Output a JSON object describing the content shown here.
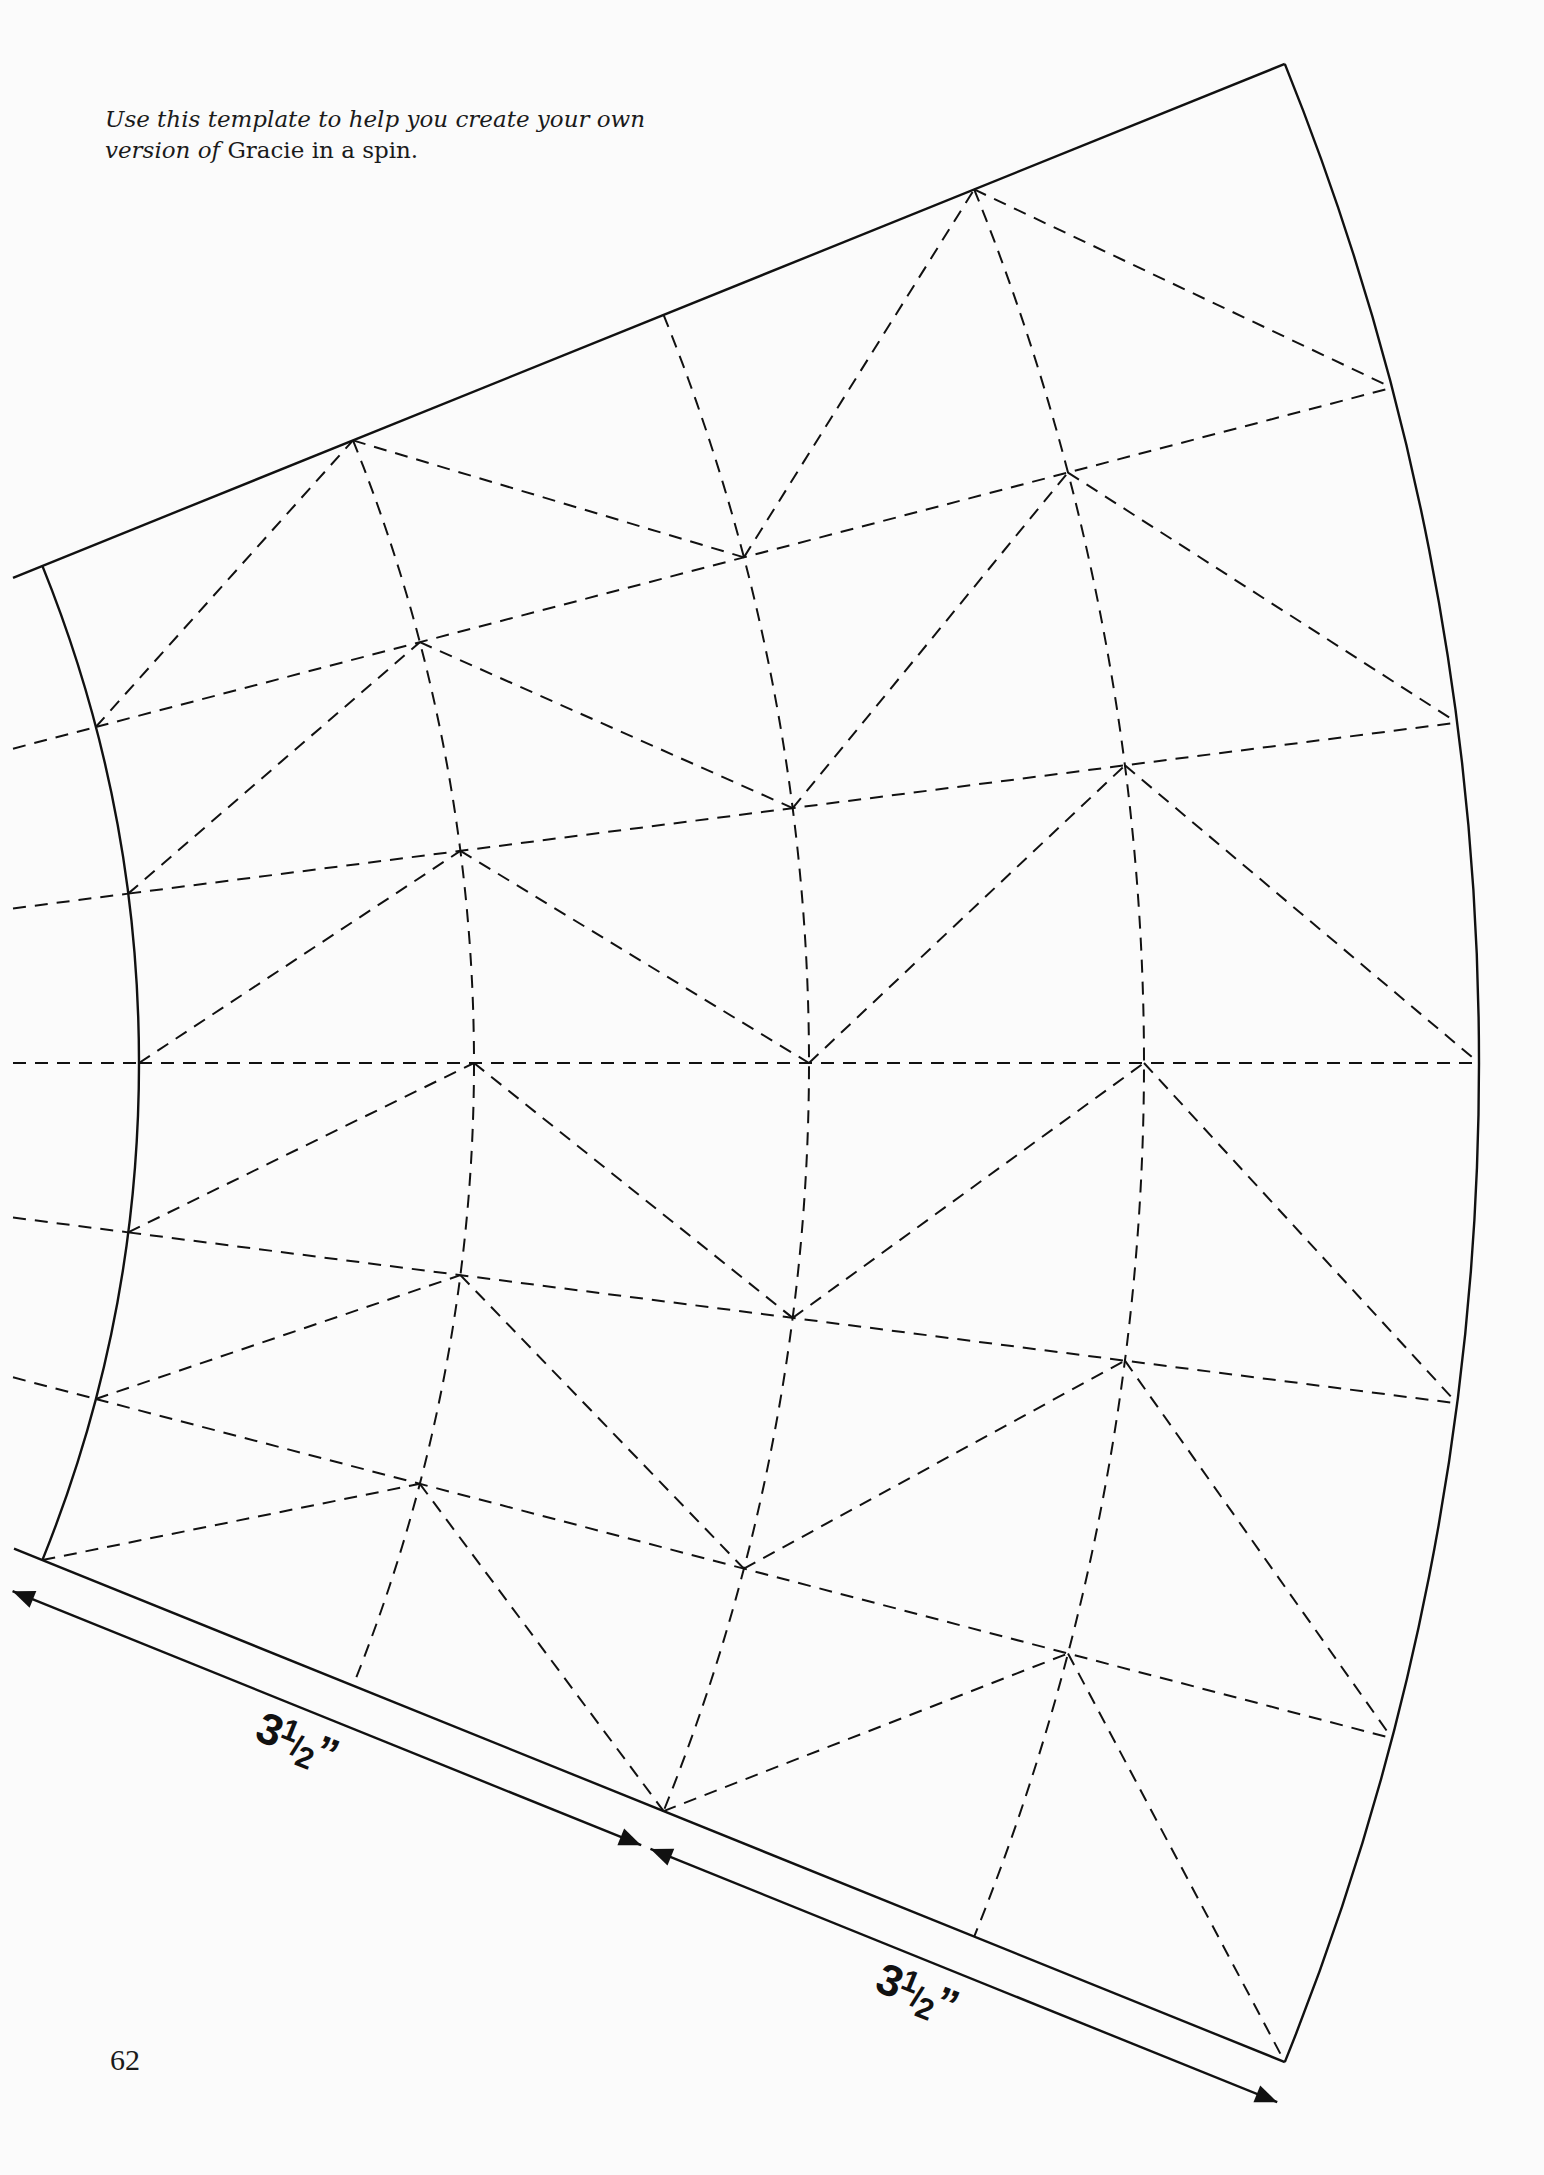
{
  "caption": {
    "italic_part": "Use this template to help you create your own version of",
    "title": "Gracie in a spin",
    "end": "."
  },
  "page_number": "62",
  "dimensions": [
    {
      "whole": "3",
      "numerator": "1",
      "denominator": "2",
      "unit": "”",
      "label": "3½”"
    },
    {
      "whole": "3",
      "numerator": "1",
      "denominator": "2",
      "unit": "”",
      "label": "3½”"
    }
  ],
  "template": {
    "shape": "annular-sector",
    "center": [
      -1188,
      1063
    ],
    "ring_radii": [
      1327,
      1662,
      1997,
      2332,
      2667
    ],
    "ray_angles_deg": [
      -22,
      -14.667,
      -7.333,
      0,
      7.333,
      14.667,
      22
    ],
    "solid_rings": [
      0,
      4
    ],
    "solid_rays": [
      0,
      6
    ],
    "ray_left_extension_x": 13,
    "diagonal_rule": "bands 0,2: inner ring at lower angle to outer ring at upper angle; bands 1,3: inner ring at upper angle to outer ring at lower angle",
    "colors": {
      "line": "#111111",
      "background": "#fbfbfb"
    }
  }
}
